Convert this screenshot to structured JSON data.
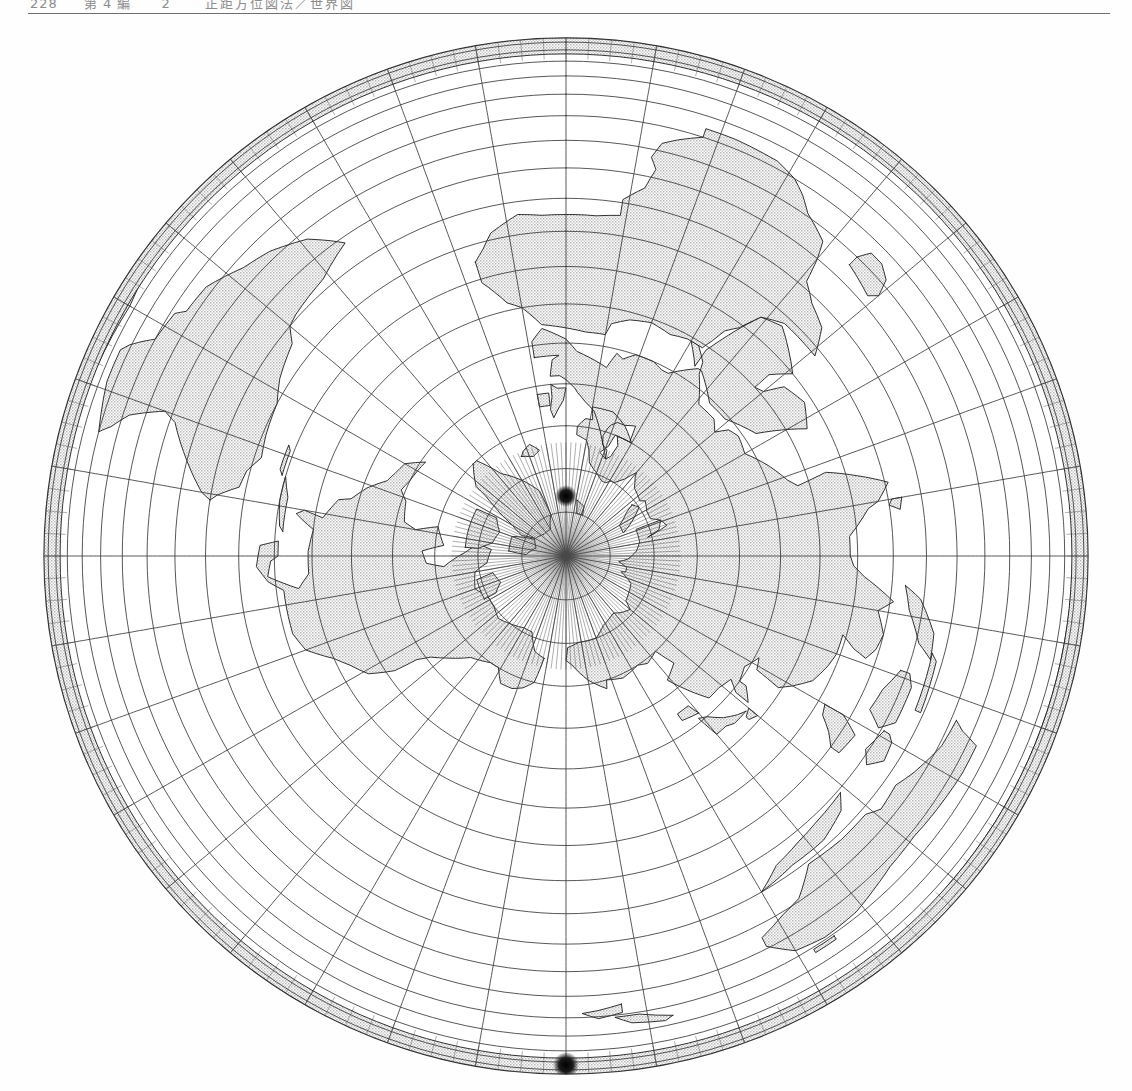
{
  "page": {
    "width": 1132,
    "height": 1091,
    "background": "#ffffff"
  },
  "running_head": {
    "folio": "228",
    "section": "第 4 編",
    "number": "2",
    "title": "正距方位図法／世界図",
    "rule_color": "#6f6f6f",
    "text_color": "#8d8d8d"
  },
  "figure": {
    "name": "world-map-azimuthal-north-pole",
    "kind": "map",
    "projection": "azimuthal / vertical perspective",
    "center": {
      "latitude": 90,
      "longitude": 0,
      "label": "North Pole"
    },
    "graticule": {
      "parallel_interval_deg": 10,
      "meridian_interval_deg": 10,
      "line_color": "#3a3a3a",
      "line_width": 0.85,
      "outline_color": "#2a2a2a",
      "outline_width": 1.3
    },
    "land": {
      "fill": "#d8d8d8",
      "stipple": true,
      "coast_color": "#1c1c1c",
      "coast_width": 0.9
    },
    "ocean": {
      "fill": "#ffffff"
    },
    "globe": {
      "cx": 566,
      "cy": 536,
      "rx": 522,
      "ry": 518
    },
    "poles": {
      "north": {
        "x": 566,
        "y": 476,
        "label": "North Pole",
        "marker": "dense-meridian-convergence"
      },
      "south": {
        "x": 566,
        "y": 1045,
        "label": "South Pole",
        "marker": "dense-meridian-convergence"
      }
    },
    "visible_regions": [
      "Eurasia",
      "Africa",
      "North America",
      "South America",
      "Greenland",
      "Australia",
      "Antarctica",
      "Japan",
      "Philippines",
      "New Zealand",
      "Madagascar",
      "Iceland",
      "British Isles"
    ]
  }
}
